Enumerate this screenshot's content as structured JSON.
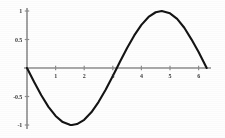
{
  "chart_data": {
    "type": "line",
    "title": "",
    "subtitle": "",
    "xlabel": "",
    "ylabel": "",
    "function": "y = -sin(x)",
    "xlim": [
      0,
      6.5
    ],
    "ylim": [
      -1.15,
      1.15
    ],
    "grid": false,
    "legend": false,
    "axis_color": "#8c8c8c",
    "curve_color": "#141414",
    "label_color": "#2a2a2a",
    "xticks": [
      {
        "value": 1,
        "label": "1"
      },
      {
        "value": 2,
        "label": "2"
      },
      {
        "value": 3,
        "label": "3"
      },
      {
        "value": 4,
        "label": "4"
      },
      {
        "value": 5,
        "label": "5"
      },
      {
        "value": 6,
        "label": "6"
      }
    ],
    "yticks": [
      {
        "value": 1,
        "label": "1"
      },
      {
        "value": 0.5,
        "label": "0.5"
      },
      {
        "value": -0.5,
        "label": "-0.5"
      },
      {
        "value": -1,
        "label": "-1"
      }
    ],
    "series": [
      {
        "name": "-sin(x)",
        "x": [
          0,
          0.25,
          0.5,
          0.75,
          1,
          1.25,
          1.5,
          1.5708,
          1.75,
          2,
          2.25,
          2.5,
          2.75,
          3,
          3.1416,
          3.25,
          3.5,
          3.75,
          4,
          4.25,
          4.5,
          4.7124,
          5,
          5.25,
          5.5,
          5.75,
          6,
          6.2832
        ],
        "y": [
          0,
          -0.247,
          -0.479,
          -0.682,
          -0.841,
          -0.949,
          -0.997,
          -1,
          -0.984,
          -0.909,
          -0.778,
          -0.598,
          -0.382,
          -0.141,
          0,
          0.108,
          0.351,
          0.572,
          0.757,
          0.895,
          0.978,
          1,
          0.959,
          0.861,
          0.706,
          0.503,
          0.279,
          0
        ]
      }
    ],
    "annotations": []
  },
  "geometry": {
    "origin_x": 27,
    "origin_y": 68,
    "x_unit_px": 28.6,
    "y_unit_px": 57,
    "x_axis_start": 24,
    "x_axis_end": 211,
    "y_axis_top": 8,
    "y_axis_bottom": 129
  }
}
